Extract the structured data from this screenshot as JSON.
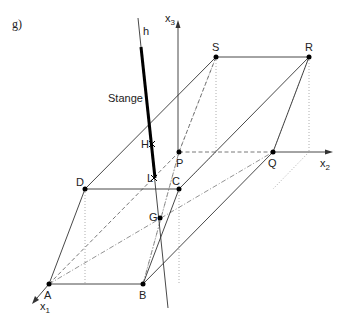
{
  "figure": {
    "label": "g)",
    "rod_label": "Stange",
    "line_label": "h"
  },
  "axes": {
    "x1": "x",
    "x1_sub": "1",
    "x2": "x",
    "x2_sub": "2",
    "x3": "x",
    "x3_sub": "3"
  },
  "points": {
    "A": "A",
    "B": "B",
    "C": "C",
    "D": "D",
    "P": "P",
    "Q": "Q",
    "R": "R",
    "S": "S",
    "G": "G",
    "H": "H",
    "L": "L"
  }
}
